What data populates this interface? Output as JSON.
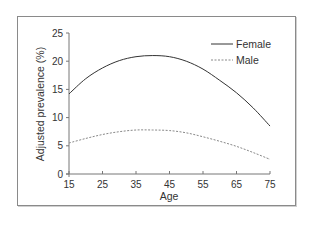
{
  "chart_data": {
    "type": "line",
    "title": "",
    "xlabel": "Age",
    "ylabel": "Adjusted prevalence (%)",
    "xlim": [
      15,
      75
    ],
    "ylim": [
      0,
      25
    ],
    "xticks": [
      15,
      25,
      35,
      45,
      55,
      65,
      75
    ],
    "yticks": [
      0,
      5,
      10,
      15,
      20,
      25
    ],
    "grid": false,
    "legend_position": "top-right",
    "x": [
      15,
      20,
      25,
      30,
      35,
      40,
      45,
      50,
      55,
      60,
      65,
      70,
      75
    ],
    "series": [
      {
        "name": "Female",
        "style": "solid",
        "color": "#333333",
        "values": [
          14.2,
          16.9,
          18.8,
          20.1,
          20.8,
          21.0,
          20.8,
          20.0,
          18.6,
          16.6,
          14.4,
          11.7,
          8.5
        ]
      },
      {
        "name": "Male",
        "style": "dashed",
        "color": "#888888",
        "values": [
          5.5,
          6.3,
          7.0,
          7.5,
          7.8,
          7.8,
          7.7,
          7.3,
          6.6,
          5.8,
          4.9,
          3.8,
          2.6
        ]
      }
    ]
  },
  "legend": {
    "female_label": "Female",
    "male_label": "Male"
  },
  "axes": {
    "x_title": "Age",
    "y_title": "Adjusted prevalence (%)",
    "x_tick_labels": [
      "15",
      "25",
      "35",
      "45",
      "55",
      "65",
      "75"
    ],
    "y_tick_labels": [
      "0",
      "5",
      "10",
      "15",
      "20",
      "25"
    ]
  }
}
